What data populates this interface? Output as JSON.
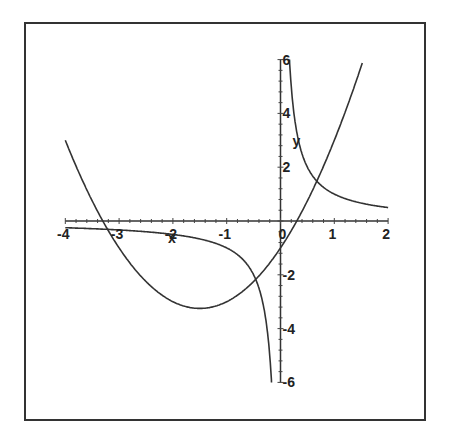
{
  "chart_data": {
    "type": "line",
    "title": "",
    "xlabel": "x",
    "ylabel": "y",
    "xlim": [
      -4,
      2
    ],
    "ylim": [
      -6,
      6
    ],
    "grid": false,
    "legend": null,
    "x_ticks": [
      "-4",
      "-3",
      "-2",
      "-1",
      "0",
      "1",
      "2"
    ],
    "y_ticks": [
      "-6",
      "-4",
      "-2",
      "2",
      "4",
      "6"
    ],
    "series": [
      {
        "name": "x^2 + 3x - 1",
        "x": [
          -4,
          -3.5,
          -3,
          -2.5,
          -2,
          -1.5,
          -1,
          -0.5,
          0,
          0.5,
          1,
          1.5
        ],
        "y": [
          3,
          0.75,
          -1,
          -2.25,
          -3,
          -3.25,
          -3,
          -2.25,
          -1,
          0.75,
          3,
          5.75
        ]
      },
      {
        "name": "1/x",
        "x": [
          -4,
          -3,
          -2,
          -1,
          -0.5,
          -0.25,
          -0.167,
          0.167,
          0.25,
          0.5,
          1,
          1.5,
          2
        ],
        "y": [
          -0.25,
          -0.33,
          -0.5,
          -1,
          -2,
          -4,
          -6,
          6,
          4,
          2,
          1,
          0.67,
          0.5
        ]
      }
    ]
  }
}
